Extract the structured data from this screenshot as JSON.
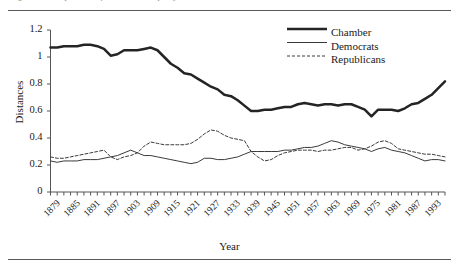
{
  "figure": {
    "caption_remnant": "Figure 1. Comparison of chamber and party mean distances, 1879-1997",
    "axis": {
      "ylabel": "Distances",
      "xlabel": "Year"
    }
  },
  "legend": {
    "position": "top-right",
    "entries": [
      {
        "label": "Chamber",
        "style": "thick-solid",
        "color": "#242424"
      },
      {
        "label": "Democrats",
        "style": "thin-solid",
        "color": "#3a3a3a"
      },
      {
        "label": "Republicans",
        "style": "dashed",
        "color": "#3a3a3a"
      }
    ]
  },
  "chart_data": {
    "type": "line",
    "title": "",
    "xlabel": "Year",
    "ylabel": "Distances",
    "xlim": [
      1879,
      1997
    ],
    "ylim": [
      0,
      1.2
    ],
    "yticks": [
      "0",
      "0.2",
      "0.4",
      "0.6",
      "0.8",
      "1",
      "1.2"
    ],
    "ytick_values": [
      0,
      0.2,
      0.4,
      0.6,
      0.8,
      1.0,
      1.2
    ],
    "xticks": [
      "1879",
      "1885",
      "1891",
      "1897",
      "1903",
      "1909",
      "1915",
      "1921",
      "1927",
      "1933",
      "1939",
      "1945",
      "1951",
      "1957",
      "1963",
      "1969",
      "1975",
      "1981",
      "1987",
      "1993"
    ],
    "xtick_values": [
      1879,
      1885,
      1891,
      1897,
      1903,
      1909,
      1915,
      1921,
      1927,
      1933,
      1939,
      1945,
      1951,
      1957,
      1963,
      1969,
      1975,
      1981,
      1987,
      1993
    ],
    "grid": false,
    "x": [
      1879,
      1881,
      1883,
      1885,
      1887,
      1889,
      1891,
      1893,
      1895,
      1897,
      1899,
      1901,
      1903,
      1905,
      1907,
      1909,
      1911,
      1913,
      1915,
      1917,
      1919,
      1921,
      1923,
      1925,
      1927,
      1929,
      1931,
      1933,
      1935,
      1937,
      1939,
      1941,
      1943,
      1945,
      1947,
      1949,
      1951,
      1953,
      1955,
      1957,
      1959,
      1961,
      1963,
      1965,
      1967,
      1969,
      1971,
      1973,
      1975,
      1977,
      1979,
      1981,
      1983,
      1985,
      1987,
      1989,
      1991,
      1993,
      1995,
      1997
    ],
    "series": [
      {
        "name": "Chamber",
        "style": "thick-solid",
        "color": "#242424",
        "values": [
          1.07,
          1.07,
          1.08,
          1.08,
          1.08,
          1.09,
          1.09,
          1.08,
          1.06,
          1.01,
          1.02,
          1.05,
          1.05,
          1.05,
          1.06,
          1.07,
          1.05,
          1.0,
          0.95,
          0.92,
          0.88,
          0.87,
          0.84,
          0.81,
          0.78,
          0.76,
          0.72,
          0.71,
          0.68,
          0.64,
          0.6,
          0.6,
          0.61,
          0.61,
          0.62,
          0.63,
          0.63,
          0.65,
          0.66,
          0.65,
          0.64,
          0.65,
          0.65,
          0.64,
          0.65,
          0.65,
          0.63,
          0.61,
          0.56,
          0.61,
          0.61,
          0.61,
          0.6,
          0.62,
          0.65,
          0.66,
          0.69,
          0.72,
          0.77,
          0.82
        ]
      },
      {
        "name": "Democrats",
        "style": "thin-solid",
        "color": "#3a3a3a",
        "values": [
          0.23,
          0.22,
          0.23,
          0.23,
          0.23,
          0.24,
          0.24,
          0.24,
          0.25,
          0.26,
          0.27,
          0.29,
          0.31,
          0.29,
          0.27,
          0.27,
          0.26,
          0.25,
          0.24,
          0.23,
          0.22,
          0.21,
          0.22,
          0.25,
          0.25,
          0.24,
          0.24,
          0.25,
          0.26,
          0.28,
          0.3,
          0.3,
          0.3,
          0.3,
          0.3,
          0.31,
          0.31,
          0.32,
          0.33,
          0.33,
          0.34,
          0.36,
          0.38,
          0.37,
          0.35,
          0.34,
          0.33,
          0.32,
          0.3,
          0.32,
          0.33,
          0.31,
          0.3,
          0.29,
          0.27,
          0.25,
          0.23,
          0.24,
          0.24,
          0.23
        ]
      },
      {
        "name": "Republicans",
        "style": "dashed",
        "color": "#3a3a3a",
        "values": [
          0.26,
          0.25,
          0.25,
          0.26,
          0.27,
          0.28,
          0.29,
          0.3,
          0.31,
          0.26,
          0.24,
          0.26,
          0.27,
          0.29,
          0.34,
          0.37,
          0.36,
          0.35,
          0.35,
          0.35,
          0.35,
          0.36,
          0.39,
          0.43,
          0.46,
          0.45,
          0.42,
          0.4,
          0.39,
          0.38,
          0.3,
          0.26,
          0.23,
          0.24,
          0.27,
          0.29,
          0.3,
          0.31,
          0.31,
          0.31,
          0.3,
          0.31,
          0.31,
          0.32,
          0.33,
          0.33,
          0.31,
          0.32,
          0.34,
          0.37,
          0.38,
          0.36,
          0.32,
          0.31,
          0.3,
          0.29,
          0.28,
          0.28,
          0.27,
          0.26
        ]
      }
    ]
  }
}
